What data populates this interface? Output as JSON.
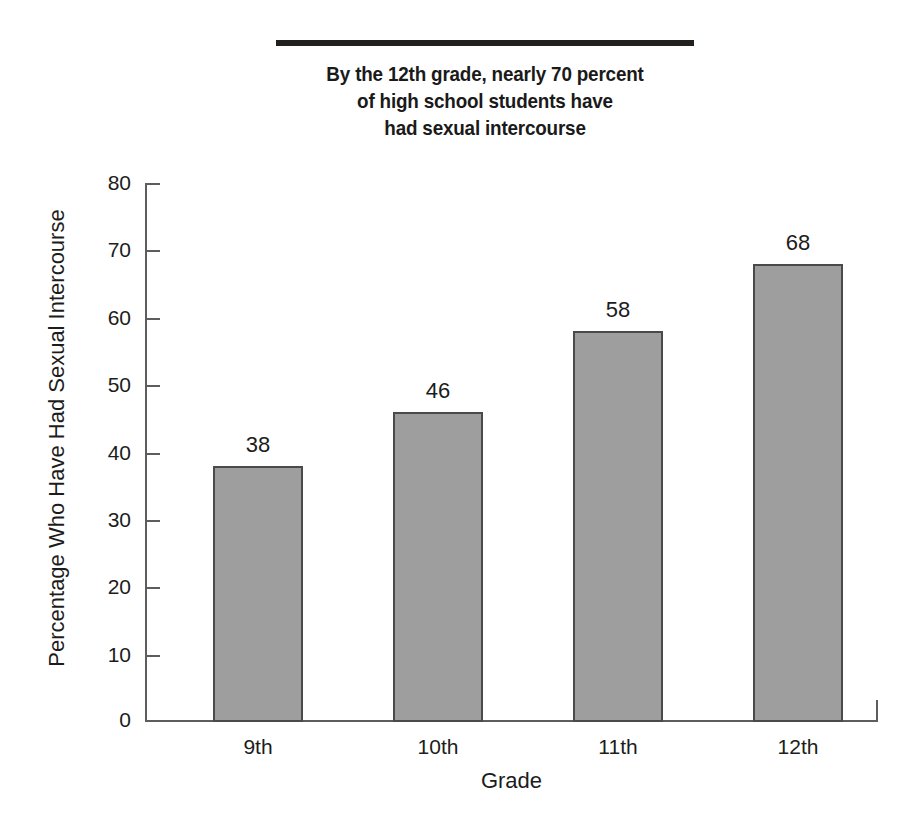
{
  "chart_data": {
    "type": "bar",
    "title": "By the 12th grade, nearly 70 percent of high school students have had sexual intercourse",
    "title_lines": [
      "By the 12th grade, nearly 70 percent",
      "of high school students have",
      "had sexual intercourse"
    ],
    "categories": [
      "9th",
      "10th",
      "11th",
      "12th"
    ],
    "values": [
      38,
      46,
      58,
      68
    ],
    "value_labels": [
      "38",
      "46",
      "58",
      "68"
    ],
    "xlabel": "Grade",
    "ylabel": "Percentage Who Have Had Sexual Intercourse",
    "ylim": [
      0,
      80
    ],
    "ytick_labels": [
      "0",
      "10",
      "20",
      "30",
      "40",
      "50",
      "60",
      "70",
      "80"
    ],
    "ytick_values": [
      0,
      10,
      20,
      30,
      40,
      50,
      60,
      70,
      80
    ],
    "grid": false,
    "legend": null,
    "bar_color": "#9e9e9e",
    "bar_border_color": "#4a4a4a",
    "axis_color": "#5d5d5d",
    "text_color": "#1c1c1c",
    "title_color": "#231f1c",
    "background_color": "#ffffff"
  }
}
